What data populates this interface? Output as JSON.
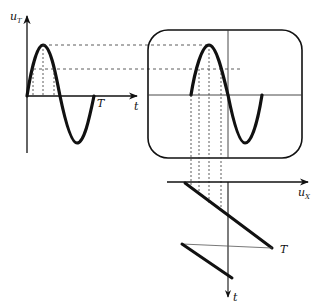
{
  "diagram": {
    "colors": {
      "ink": "#111111",
      "dashed": "#333333",
      "background": "#ffffff"
    },
    "input_signal_panel": {
      "y_axis_label": "u",
      "y_axis_subscript": "T",
      "x_axis_label": "t",
      "period_label": "T"
    },
    "screen_panel": {
      "description": "Oscilloscope screen with crosshair showing one sine period"
    },
    "sweep_panel": {
      "x_axis_label": "u",
      "x_axis_subscript": "X",
      "y_axis_label": "t",
      "period_label": "T"
    }
  }
}
